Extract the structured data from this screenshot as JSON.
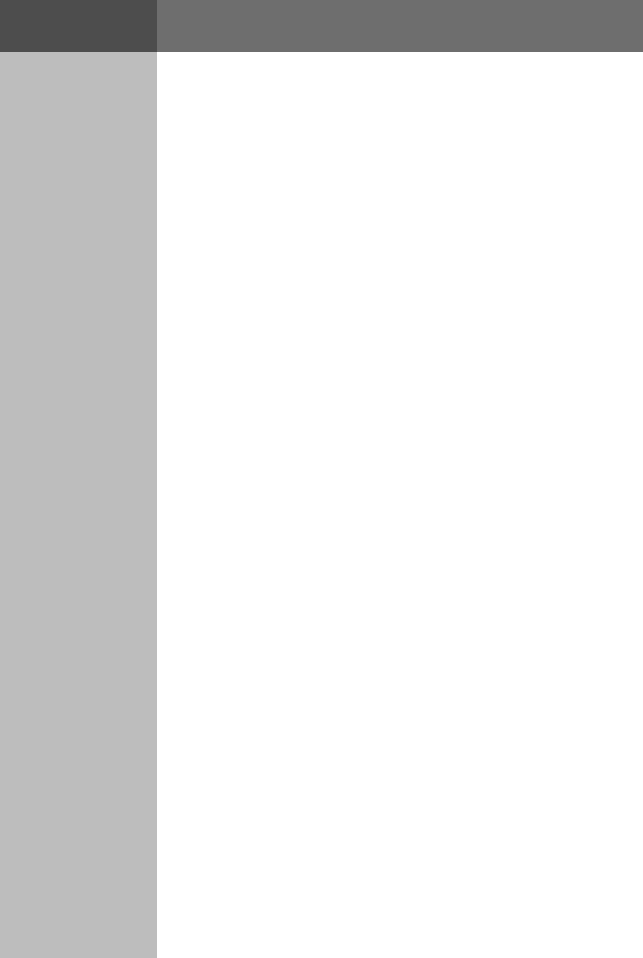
{
  "window": {
    "width": 643,
    "height": 958,
    "background_color": "#ffffff"
  },
  "header": {
    "height": 52,
    "left_segment": {
      "width": 157,
      "color": "#4d4d4d"
    },
    "right_segment": {
      "color": "#6e6e6e"
    }
  },
  "sidebar": {
    "width": 157,
    "color": "#bdbdbd",
    "items": []
  },
  "content": {
    "color": "#ffffff",
    "blocks": []
  }
}
